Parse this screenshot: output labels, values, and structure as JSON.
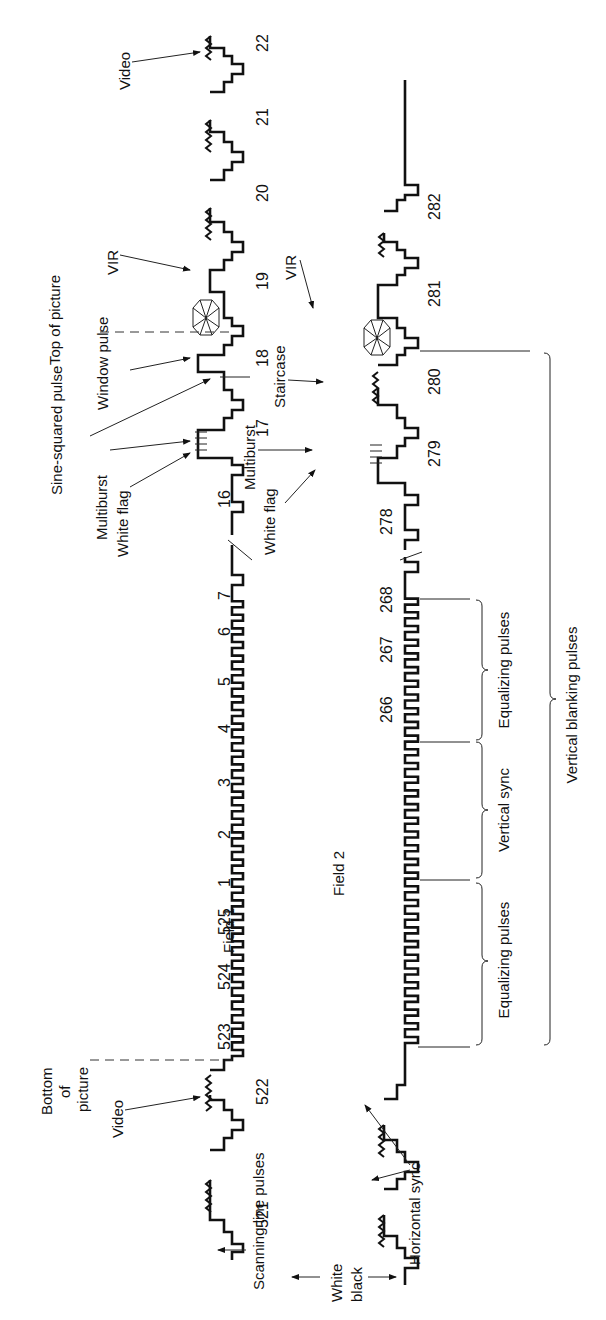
{
  "figure": {
    "orientation": "rotated -90deg (text reads bottom-to-top)",
    "field1": {
      "label": "Field 1",
      "line_numbers": [
        "521",
        "522",
        "523",
        "524",
        "525",
        "1",
        "2",
        "3",
        "4",
        "5",
        "6",
        "7",
        "16",
        "17",
        "18",
        "19",
        "20",
        "21",
        "22"
      ],
      "annotations": {
        "scanning_line_pulses": "Scanning line pulses",
        "video_bottom": "Video",
        "bottom_of_picture": "Bottom of picture",
        "white_flag": "White flag",
        "multiburst": "Multiburst",
        "sine_squared": "Sine-squared pulse",
        "window_pulse": "Window pulse",
        "top_of_picture": "Top of picture",
        "vir": "VIR",
        "video_top": "Video"
      }
    },
    "field2": {
      "label": "Field 2",
      "line_numbers": [
        "266",
        "267",
        "268",
        "278",
        "279",
        "280",
        "281",
        "282"
      ],
      "annotations": {
        "horizontal_sync": "Horizontal sync",
        "white_flag": "White flag",
        "multiburst": "Multiburst",
        "staircase": "Staircase",
        "vir": "VIR"
      }
    },
    "brackets": {
      "equalizing_1": "Equalizing pulses",
      "vertical_sync": "Vertical sync",
      "equalizing_2": "Equalizing pulses",
      "vertical_blanking": "Vertical blanking pulses"
    },
    "legend": {
      "white": "White",
      "black": "black"
    }
  }
}
